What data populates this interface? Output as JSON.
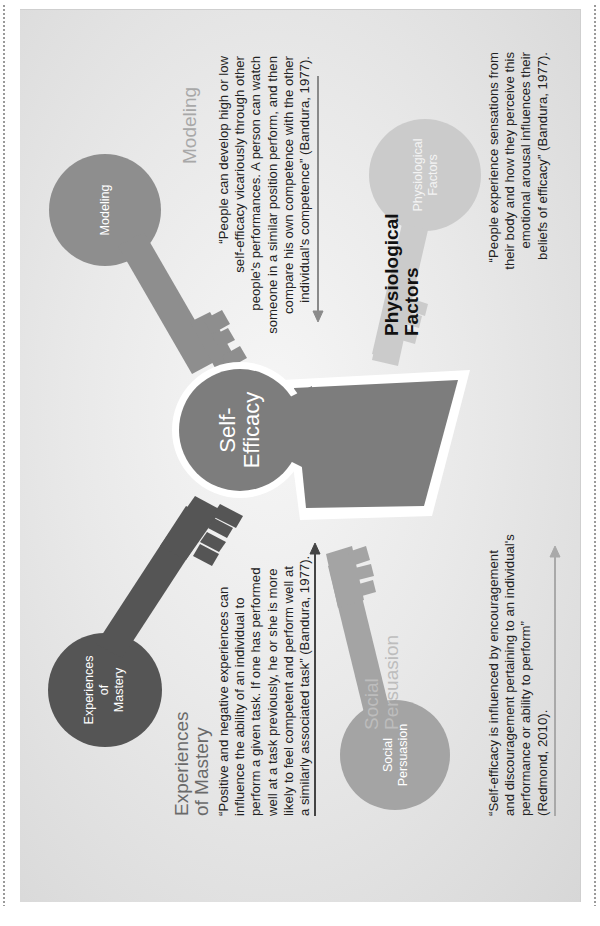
{
  "center": {
    "label_line1": "Self-",
    "label_line2": "Efficacy",
    "color": "#7d7d7d"
  },
  "keys": {
    "modeling": {
      "circle_label": "Modeling",
      "title": "Modeling",
      "quote_lines": [
        "“People can develop high or low",
        "self-efficacy vicariously through other",
        "people's performances. A person can watch",
        "someone in a similar position perform, and then",
        "compare his own competence with the other",
        "individual's competence” (Bandura, 1977)."
      ],
      "color": "#8e8e8e",
      "title_color": "#a8a8a8"
    },
    "mastery": {
      "circle_label_line1": "Experiences",
      "circle_label_line2": "of",
      "circle_label_line3": "Mastery",
      "title_line1": "Experiences",
      "title_line2": "of Mastery",
      "quote_lines": [
        "“Positive and negative experiences can",
        "influence the ability of an individual to",
        "perform a given task. If one has performed",
        "well at a task previously, he or she is more",
        "likely to feel competent and perform well at",
        "a similarly associated task” (Bandura, 1977)."
      ],
      "color": "#555555",
      "title_color": "#6a6a6a"
    },
    "social": {
      "circle_label_line1": "Social",
      "circle_label_line2": "Persuasion",
      "title_line1": "Social",
      "title_line2": "Persuasion",
      "quote_lines": [
        "“Self-efficacy is influenced by encouragement",
        "and discouragement pertaining to an individual's",
        "performance or ability to perform”",
        "(Redmond, 2010)."
      ],
      "color": "#a4a4a4",
      "title_color": "#bdbdbd"
    },
    "physiological": {
      "circle_label_line1": "Physiological",
      "circle_label_line2": "Factors",
      "title_line1": "Physiological",
      "title_line2": "Factors",
      "quote_lines": [
        "“People experience sensations from",
        "their body and how they perceive this",
        "emotional arousal influences their",
        "beliefs of efficacy” (Bandura, 1977)."
      ],
      "color": "#cbcbcb",
      "title_color": "#111111"
    }
  },
  "arrows": {
    "mastery_color": "#444444",
    "modeling_color": "#8a8a8a",
    "social_color": "#a9a9a9"
  }
}
